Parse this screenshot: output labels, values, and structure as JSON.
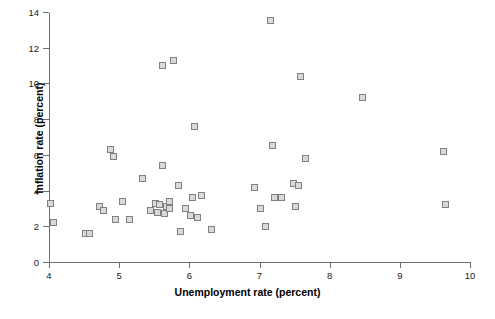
{
  "chart_data": {
    "type": "scatter",
    "title": "",
    "xlabel": "Unemployment rate (percent)",
    "ylabel": "Inflation rate (percent)",
    "xlim": [
      4,
      10
    ],
    "ylim": [
      0,
      14
    ],
    "xticks": [
      4,
      5,
      6,
      7,
      8,
      9,
      10
    ],
    "yticks": [
      0,
      2,
      4,
      6,
      8,
      10,
      12,
      14
    ],
    "xtick_labels": [
      "4",
      "5",
      "6",
      "7",
      "8",
      "9",
      "10"
    ],
    "ytick_labels": [
      "0",
      "2",
      "4",
      "6",
      "8",
      "10",
      "12",
      "14"
    ],
    "grid": false,
    "legend": false,
    "marker": "square",
    "marker_fill": "#d9d9d9",
    "marker_edge": "#808080",
    "points": [
      {
        "x": 4.02,
        "y": 3.3
      },
      {
        "x": 4.07,
        "y": 2.2
      },
      {
        "x": 4.52,
        "y": 1.6
      },
      {
        "x": 4.72,
        "y": 3.1
      },
      {
        "x": 4.78,
        "y": 2.9
      },
      {
        "x": 4.88,
        "y": 6.3
      },
      {
        "x": 4.92,
        "y": 5.9
      },
      {
        "x": 4.95,
        "y": 2.4
      },
      {
        "x": 5.05,
        "y": 3.4
      },
      {
        "x": 5.33,
        "y": 4.7
      },
      {
        "x": 5.45,
        "y": 2.9
      },
      {
        "x": 5.52,
        "y": 3.3
      },
      {
        "x": 5.55,
        "y": 2.8
      },
      {
        "x": 5.58,
        "y": 3.2
      },
      {
        "x": 5.62,
        "y": 5.4
      },
      {
        "x": 5.62,
        "y": 11.0
      },
      {
        "x": 5.65,
        "y": 2.7
      },
      {
        "x": 5.68,
        "y": 3.1
      },
      {
        "x": 5.72,
        "y": 3.0
      },
      {
        "x": 5.78,
        "y": 11.3
      },
      {
        "x": 5.85,
        "y": 4.3
      },
      {
        "x": 5.87,
        "y": 1.7
      },
      {
        "x": 5.95,
        "y": 3.0
      },
      {
        "x": 6.02,
        "y": 2.6
      },
      {
        "x": 6.07,
        "y": 7.6
      },
      {
        "x": 6.12,
        "y": 2.5
      },
      {
        "x": 6.18,
        "y": 3.7
      },
      {
        "x": 6.32,
        "y": 1.8
      },
      {
        "x": 6.93,
        "y": 4.2
      },
      {
        "x": 7.02,
        "y": 3.0
      },
      {
        "x": 7.08,
        "y": 2.0
      },
      {
        "x": 7.15,
        "y": 13.5
      },
      {
        "x": 7.18,
        "y": 6.5
      },
      {
        "x": 7.32,
        "y": 3.6
      },
      {
        "x": 7.48,
        "y": 4.4
      },
      {
        "x": 7.52,
        "y": 3.1
      },
      {
        "x": 7.58,
        "y": 10.4
      },
      {
        "x": 7.65,
        "y": 5.8
      },
      {
        "x": 8.47,
        "y": 9.2
      },
      {
        "x": 9.62,
        "y": 6.2
      },
      {
        "x": 9.65,
        "y": 3.2
      },
      {
        "x": 4.58,
        "y": 1.6
      },
      {
        "x": 5.15,
        "y": 2.4
      },
      {
        "x": 5.72,
        "y": 3.4
      },
      {
        "x": 6.05,
        "y": 3.6
      },
      {
        "x": 6.93,
        "y": 4.2
      },
      {
        "x": 7.22,
        "y": 3.6
      },
      {
        "x": 7.55,
        "y": 4.3
      }
    ]
  }
}
